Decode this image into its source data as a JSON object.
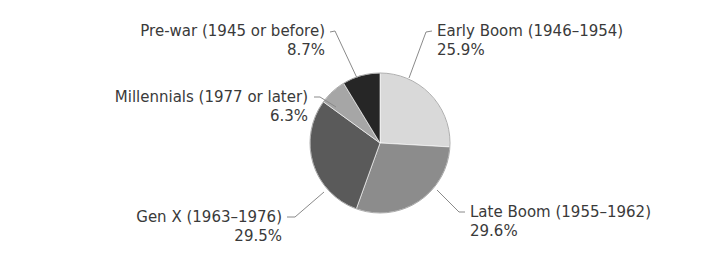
{
  "chart_data": {
    "type": "pie",
    "title": "",
    "start_angle": "12 o'clock",
    "direction": "clockwise",
    "slices": [
      {
        "label": "Early Boom (1946–1954)",
        "value": 25.9,
        "value_label": "25.9%",
        "color": "#d9d9d9"
      },
      {
        "label": "Late Boom (1955–1962)",
        "value": 29.6,
        "value_label": "29.6%",
        "color": "#8c8c8c"
      },
      {
        "label": "Gen X (1963–1976)",
        "value": 29.5,
        "value_label": "29.5%",
        "color": "#5a5a5a"
      },
      {
        "label": "Millennials (1977 or later)",
        "value": 6.3,
        "value_label": "6.3%",
        "color": "#a6a6a6"
      },
      {
        "label": "Pre-war (1945 or before)",
        "value": 8.7,
        "value_label": "8.7%",
        "color": "#262626"
      }
    ],
    "categories": [
      "Early Boom (1946–1954)",
      "Late Boom (1955–1962)",
      "Gen X (1963–1976)",
      "Millennials (1977 or later)",
      "Pre-war (1945 or before)"
    ],
    "values": [
      25.9,
      29.6,
      29.5,
      6.3,
      8.7
    ],
    "legend": "none (callout labels with leader lines)"
  },
  "labels": {
    "early_boom": {
      "name": "Early Boom (1946–1954)",
      "pct": "25.9%"
    },
    "late_boom": {
      "name": "Late Boom (1955–1962)",
      "pct": "29.6%"
    },
    "gen_x": {
      "name": "Gen X (1963–1976)",
      "pct": "29.5%"
    },
    "millennials": {
      "name": "Millennials (1977 or later)",
      "pct": "6.3%"
    },
    "pre_war": {
      "name": "Pre-war (1945 or before)",
      "pct": "8.7%"
    }
  }
}
